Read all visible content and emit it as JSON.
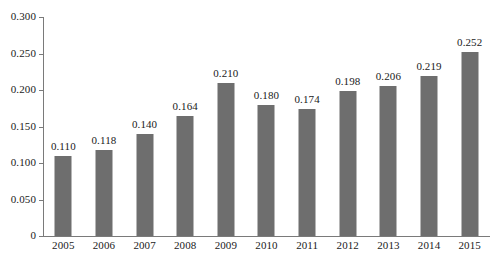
{
  "chart_data": {
    "type": "bar",
    "title": "",
    "subtitle": "",
    "xlabel": "",
    "ylabel": "",
    "categories": [
      "2005",
      "2006",
      "2007",
      "2008",
      "2009",
      "2010",
      "2011",
      "2012",
      "2013",
      "2014",
      "2015"
    ],
    "values": [
      0.11,
      0.118,
      0.14,
      0.164,
      0.21,
      0.18,
      0.174,
      0.198,
      0.206,
      0.219,
      0.252
    ],
    "value_labels": [
      "0.110",
      "0.118",
      "0.140",
      "0.164",
      "0.210",
      "0.180",
      "0.174",
      "0.198",
      "0.206",
      "0.219",
      "0.252"
    ],
    "ylim": [
      0,
      0.3
    ],
    "y_ticks": [
      0,
      0.05,
      0.1,
      0.15,
      0.2,
      0.25,
      0.3
    ],
    "y_tick_labels": [
      "0",
      "0.050",
      "0.100",
      "0.150",
      "0.200",
      "0.250",
      "0.300"
    ],
    "grid": false,
    "legend": null,
    "legend_position": "none",
    "bar_color": "#6e6e6e",
    "axis_color": "#7a7a7a",
    "background_color": "#ffffff",
    "text_color": "#1a1a1a",
    "data_labels_shown": true
  }
}
